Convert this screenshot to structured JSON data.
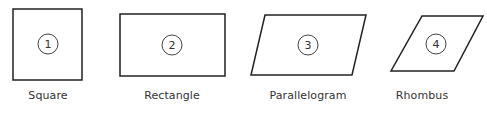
{
  "shapes": [
    {
      "id": 1,
      "number": "1",
      "label": "Square",
      "cx": 48,
      "cy": 44,
      "points": "13,9 82,9 82,80 13,80",
      "label_x": 48
    },
    {
      "id": 2,
      "number": "2",
      "label": "Rectangle",
      "cx": 172,
      "cy": 45,
      "points": "120,14 225,14 225,76 120,76",
      "label_x": 172
    },
    {
      "id": 3,
      "number": "3",
      "label": "Parallelogram",
      "cx": 308,
      "cy": 45,
      "points": "265,15 366,15 352,75 251,75",
      "label_x": 308
    },
    {
      "id": 4,
      "number": "4",
      "label": "Rhombus",
      "cx": 436,
      "cy": 44,
      "points": "422,16 483,16 454,71 391,71",
      "label_x": 422
    }
  ],
  "colors": {
    "stroke": "#222222",
    "text": "#333333"
  }
}
